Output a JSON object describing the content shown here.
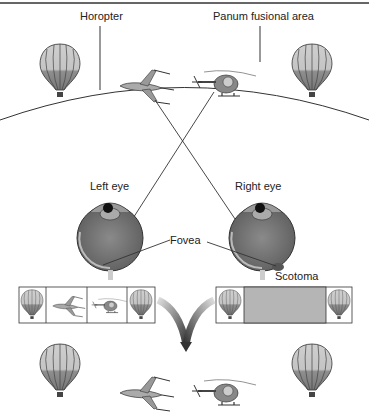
{
  "labels": {
    "horopter": "Horopter",
    "panum": "Panum fusional area",
    "left_eye": "Left eye",
    "right_eye": "Right eye",
    "fovea": "Fovea",
    "scotoma": "Scotoma"
  },
  "panels": {
    "left_percept": [
      "balloon",
      "airplane",
      "helicopter",
      "balloon"
    ],
    "right_percept": [
      "balloon",
      "scotoma-gray",
      "balloon"
    ]
  },
  "colors": {
    "line": "#333333",
    "eye_gray": "#7a7a7a",
    "scotoma_fill": "#b5b5b5",
    "arrow": "#444444"
  }
}
